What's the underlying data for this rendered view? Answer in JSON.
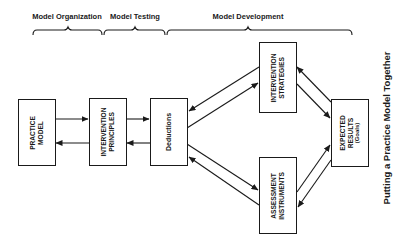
{
  "diagram": {
    "title": "Putting a Practice Model Together",
    "phases": [
      {
        "label": "Model Organization"
      },
      {
        "label": "Model Testing"
      },
      {
        "label": "Model Development"
      }
    ],
    "nodes": {
      "practice_model": {
        "line1": "PRACTICE",
        "line2": "MODEL"
      },
      "intervention_principles": {
        "line1": "INTERVENTION",
        "line2": "PRINCIPLES"
      },
      "deductions": {
        "line1": "Deductions"
      },
      "intervention_strategies": {
        "line1": "INTERVENTION",
        "line2": "STRATEGIES"
      },
      "assessment_instruments": {
        "line1": "ASSESSMENT",
        "line2": "INSTRUMENTS"
      },
      "expected_results": {
        "line1": "EXPECTED",
        "line2": "RESULTS",
        "line3": "(Goals)"
      }
    },
    "edges": [
      {
        "from": "practice_model",
        "to": "intervention_principles"
      },
      {
        "from": "intervention_principles",
        "to": "practice_model"
      },
      {
        "from": "intervention_principles",
        "to": "deductions"
      },
      {
        "from": "deductions",
        "to": "intervention_principles"
      },
      {
        "from": "deductions",
        "to": "intervention_strategies"
      },
      {
        "from": "intervention_strategies",
        "to": "deductions"
      },
      {
        "from": "deductions",
        "to": "assessment_instruments"
      },
      {
        "from": "assessment_instruments",
        "to": "deductions"
      },
      {
        "from": "intervention_strategies",
        "to": "expected_results"
      },
      {
        "from": "expected_results",
        "to": "intervention_strategies"
      },
      {
        "from": "assessment_instruments",
        "to": "expected_results"
      },
      {
        "from": "expected_results",
        "to": "assessment_instruments"
      }
    ]
  }
}
